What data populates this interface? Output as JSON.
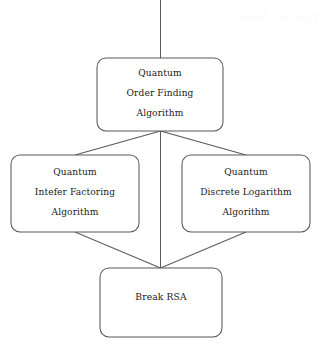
{
  "diagram": {
    "type": "flowchart",
    "title": "",
    "background_color": "#ffffff",
    "stroke_color": "#595959",
    "text_color": "#1a1a1a",
    "nodes": [
      {
        "id": "order-finding",
        "role": "root",
        "lines": [
          "Quantum",
          "Order Finding",
          "Algorithm"
        ],
        "x": 97,
        "y": 58,
        "width": 126,
        "height": 73
      },
      {
        "id": "integer-factoring",
        "role": "branch-left",
        "lines": [
          "Quantum",
          "Intefer Factoring",
          "Algorithm"
        ],
        "x": 11,
        "y": 155,
        "width": 128,
        "height": 77
      },
      {
        "id": "discrete-logarithm",
        "role": "branch-right",
        "lines": [
          "Quantum",
          "Discrete Logarithm",
          "Algorithm"
        ],
        "x": 182,
        "y": 155,
        "width": 128,
        "height": 77
      },
      {
        "id": "break-rsa",
        "role": "leaf",
        "lines": [
          "Break RSA"
        ],
        "x": 100,
        "y": 268,
        "width": 122,
        "height": 69
      }
    ],
    "edges": [
      {
        "id": "inbound-top",
        "from": "above",
        "to": "order-finding"
      },
      {
        "id": "order-finding-to-integer-factoring",
        "from": "order-finding",
        "to": "integer-factoring"
      },
      {
        "id": "order-finding-to-break-rsa",
        "from": "order-finding",
        "to": "break-rsa"
      },
      {
        "id": "order-finding-to-discrete-logarithm",
        "from": "order-finding",
        "to": "discrete-logarithm"
      },
      {
        "id": "integer-factoring-to-break-rsa",
        "from": "integer-factoring",
        "to": "break-rsa"
      },
      {
        "id": "discrete-logarithm-to-break-rsa",
        "from": "discrete-logarithm",
        "to": "break-rsa"
      }
    ],
    "artifact": {
      "text": "bleed-through",
      "visible": "faint"
    }
  }
}
